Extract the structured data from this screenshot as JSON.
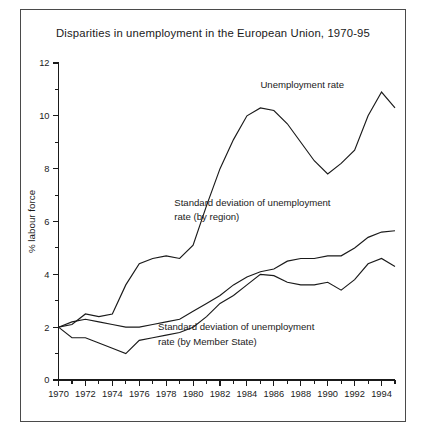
{
  "figure": {
    "title": "Disparities in unemployment in the European Union, 1970-95"
  },
  "chart_data": {
    "type": "line",
    "title": "Disparities in unemployment in the European Union, 1970-95",
    "xlabel": "",
    "ylabel": "% labour force",
    "xlim": [
      1970,
      1995
    ],
    "ylim": [
      0,
      12
    ],
    "grid": false,
    "legend_position": "inline-annotations",
    "y_major_ticks": [
      0,
      2,
      4,
      6,
      8,
      10,
      12
    ],
    "y_minor_ticks": [
      1,
      3,
      5,
      7,
      9,
      11
    ],
    "y_tick_labels": [
      "0",
      "2",
      "4",
      "6",
      "8",
      "10",
      "12"
    ],
    "x_ticks": [
      1970,
      1971,
      1972,
      1973,
      1974,
      1975,
      1976,
      1977,
      1978,
      1979,
      1980,
      1981,
      1982,
      1983,
      1984,
      1985,
      1986,
      1987,
      1988,
      1989,
      1990,
      1991,
      1992,
      1993,
      1994,
      1995
    ],
    "x_tick_labels": [
      "1970",
      "",
      "1972",
      "",
      "1974",
      "",
      "1976",
      "",
      "1978",
      "",
      "1980",
      "",
      "1982",
      "",
      "1984",
      "",
      "1986",
      "",
      "1988",
      "",
      "1990",
      "",
      "1992",
      "",
      "1994",
      ""
    ],
    "x": [
      1970,
      1971,
      1972,
      1973,
      1974,
      1975,
      1976,
      1977,
      1978,
      1979,
      1980,
      1981,
      1982,
      1983,
      1984,
      1985,
      1986,
      1987,
      1988,
      1989,
      1990,
      1991,
      1992,
      1993,
      1994,
      1995
    ],
    "series": [
      {
        "name": "Unemployment rate",
        "values": [
          2.0,
          2.1,
          2.5,
          2.4,
          2.5,
          3.6,
          4.4,
          4.6,
          4.7,
          4.6,
          5.1,
          6.6,
          8.0,
          9.1,
          10.0,
          10.3,
          10.2,
          9.7,
          9.0,
          8.3,
          7.8,
          8.2,
          8.7,
          10.0,
          10.9,
          10.3
        ],
        "label_text": "Unemployment rate",
        "label_position": {
          "x": 1985.0,
          "y": 11.05
        }
      },
      {
        "name": "Standard deviation of unemployment rate (by region)",
        "values": [
          2.0,
          2.2,
          2.3,
          2.2,
          2.1,
          2.0,
          2.0,
          2.1,
          2.2,
          2.3,
          2.6,
          2.9,
          3.2,
          3.6,
          3.9,
          4.1,
          4.2,
          4.5,
          4.6,
          4.6,
          4.7,
          4.7,
          5.0,
          5.4,
          5.6,
          5.65
        ],
        "label_text": "Standard deviation of unemployment rate (by region)",
        "label_position": {
          "x": 1978.6,
          "y": 6.45
        }
      },
      {
        "name": "Standard deviation of unemployment rate (by Member State)",
        "values": [
          2.0,
          1.6,
          1.6,
          1.4,
          1.2,
          1.0,
          1.5,
          1.6,
          1.7,
          1.8,
          2.0,
          2.4,
          2.9,
          3.2,
          3.6,
          4.0,
          3.95,
          3.7,
          3.6,
          3.6,
          3.7,
          3.4,
          3.8,
          4.4,
          4.6,
          4.3
        ],
        "label_text": "Standard deviation of unemployment rate (by Member State)",
        "label_position": {
          "x": 1977.4,
          "y": 1.72
        }
      }
    ],
    "annotations": [
      {
        "text": "Unemployment rate",
        "x": 1985.0,
        "y": 11.05
      },
      {
        "text": "Standard deviation of unemployment",
        "x": 1978.6,
        "y": 6.6
      },
      {
        "text": "rate (by region)",
        "x": 1978.6,
        "y": 6.05
      },
      {
        "text": "Standard deviation of unemployment",
        "x": 1977.4,
        "y": 1.88
      },
      {
        "text": "rate (by Member State)",
        "x": 1977.4,
        "y": 1.33
      }
    ]
  }
}
